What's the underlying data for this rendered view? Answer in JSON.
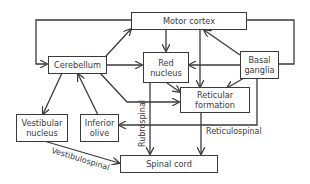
{
  "diagram": {
    "colors": {
      "line": "#3a3a3a",
      "background": "#ffffff"
    },
    "nodes": {
      "motor_cortex": "Motor cortex",
      "cerebellum": "Cerebellum",
      "red_nucleus": "Red\nnucleus",
      "basal_ganglia": "Basal\nganglia",
      "reticular_formation": "Reticular\nformation",
      "vestibular_nucleus": "Vestibular\nnucleus",
      "inferior_olive": "Inferior\nolive",
      "spinal_cord": "Spinal cord"
    },
    "edge_labels": {
      "rubrospinal": "Rubrospinal",
      "reticulospinal": "Reticulospinal",
      "vestibulospinal": "Vestibulospinal"
    },
    "edges": [
      {
        "from": "Motor cortex",
        "to": "Cerebellum"
      },
      {
        "from": "Cerebellum",
        "to": "Motor cortex"
      },
      {
        "from": "Motor cortex",
        "to": "Red nucleus"
      },
      {
        "from": "Motor cortex",
        "to": "Reticular formation"
      },
      {
        "from": "Motor cortex",
        "to": "Basal ganglia"
      },
      {
        "from": "Basal ganglia",
        "to": "Motor cortex"
      },
      {
        "from": "Basal ganglia",
        "to": "Red nucleus"
      },
      {
        "from": "Basal ganglia",
        "to": "Reticular formation"
      },
      {
        "from": "Basal ganglia",
        "to": "Inferior olive"
      },
      {
        "from": "Cerebellum",
        "to": "Red nucleus"
      },
      {
        "from": "Cerebellum",
        "to": "Reticular formation"
      },
      {
        "from": "Cerebellum",
        "to": "Vestibular nucleus"
      },
      {
        "from": "Inferior olive",
        "to": "Cerebellum"
      },
      {
        "from": "Red nucleus",
        "to": "Reticular formation"
      },
      {
        "from": "Red nucleus",
        "to": "Spinal cord",
        "label": "Rubrospinal"
      },
      {
        "from": "Reticular formation",
        "to": "Spinal cord",
        "label": "Reticulospinal"
      },
      {
        "from": "Vestibular nucleus",
        "to": "Spinal cord",
        "label": "Vestibulospinal"
      }
    ]
  }
}
